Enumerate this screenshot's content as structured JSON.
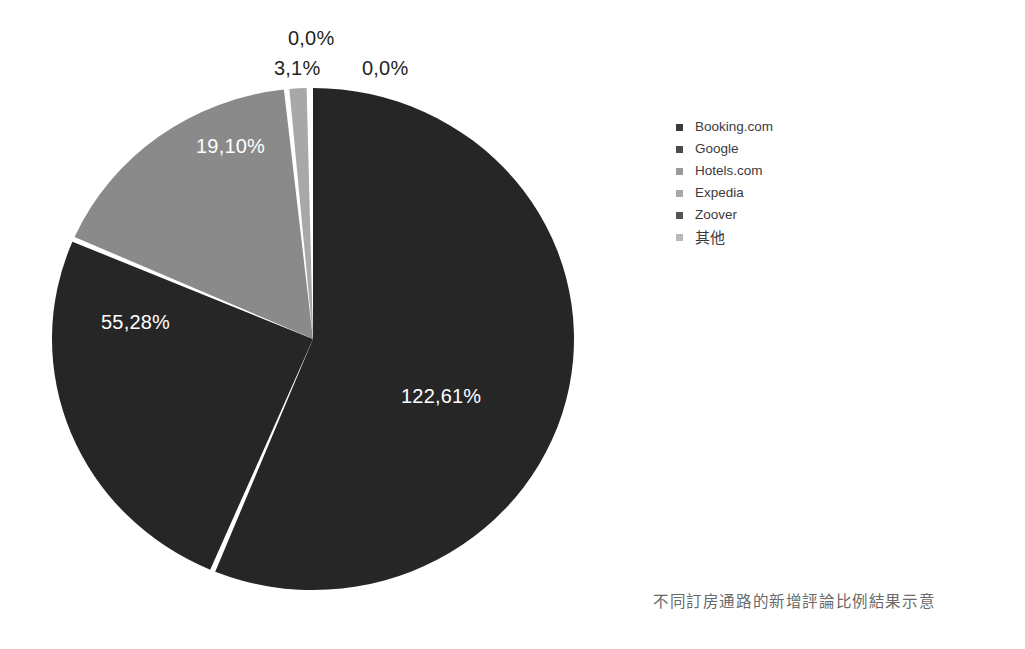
{
  "chart_data": {
    "type": "pie",
    "title": "",
    "caption": "不同訂房通路的新增評論比例結果示意",
    "categories": [
      "Booking.com",
      "Google",
      "Hotels.com",
      "Expedia",
      "Zoover",
      "其他"
    ],
    "value_labels": [
      "122,61%",
      "0,0%",
      "0,0%",
      "0,0%",
      "55,28%",
      "19,10%"
    ],
    "values": [
      122.61,
      0.0,
      0.0,
      0.0,
      55.28,
      19.1
    ],
    "extra_labels": [
      "3,1%"
    ],
    "colors": [
      "#262626",
      "#262626",
      "#8a8a8a",
      "#9a9a9a",
      "#262626",
      "#8a8a8a"
    ],
    "slice_separator_color": "#ffffff",
    "legend_position": "right",
    "grid": false,
    "slices": [
      {
        "name": "Booking.com",
        "label": "122,61%",
        "value": 122.61,
        "color": "#262626",
        "start_deg": 0,
        "end_deg": 202.0,
        "label_color": "#ffffff"
      },
      {
        "name": "Zoover",
        "label": "55,28%",
        "value": 55.28,
        "color": "#262626",
        "start_deg": 203.2,
        "end_deg": 292.8,
        "label_color": "#ffffff"
      },
      {
        "name": "其他",
        "label": "19,10%",
        "value": 19.1,
        "color": "#8a8a8a",
        "start_deg": 294.0,
        "end_deg": 353.6,
        "label_color": "#ffffff"
      },
      {
        "name": "sliver",
        "label": "3,1%",
        "value": 3.1,
        "color": "#a8a8a8",
        "start_deg": 354.8,
        "end_deg": 358.6,
        "label_color": "#231f20"
      }
    ]
  },
  "labels": {
    "zero_top": "0,0%",
    "three_one": "3,1%",
    "zero_right": "0,0%",
    "nineteen": "19,10%",
    "fiftyfive": "55,28%",
    "onetwentytwo": "122,61%"
  },
  "legend": {
    "items": [
      {
        "label": "Booking.com",
        "swatch": "#3a3a3a"
      },
      {
        "label": "Google",
        "swatch": "#4a4a4a"
      },
      {
        "label": "Hotels.com",
        "swatch": "#9a9a9a"
      },
      {
        "label": "Expedia",
        "swatch": "#a8a8a8"
      },
      {
        "label": "Zoover",
        "swatch": "#545454"
      },
      {
        "label": "其他",
        "swatch": "#b8b8b8"
      }
    ]
  },
  "caption": {
    "text": "不同訂房通路的新增評論比例結果示意"
  }
}
